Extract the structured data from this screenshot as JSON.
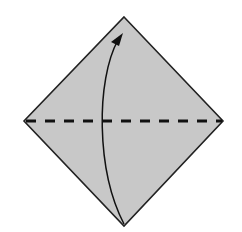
{
  "diagram": {
    "type": "origami-fold-step",
    "description": "Valley fold: fold bottom corner up to top corner along horizontal diagonal",
    "paper": {
      "shape": "diamond",
      "fill": "#c8c8c8",
      "stroke": "#222222",
      "vertices": {
        "top": [
          124,
          17
        ],
        "right": [
          223,
          121
        ],
        "bottom": [
          124,
          226
        ],
        "left": [
          24,
          121
        ]
      }
    },
    "fold_line": {
      "style": "dashed",
      "kind": "valley-fold",
      "from": [
        26,
        121
      ],
      "to": [
        222,
        121
      ],
      "color": "#111111",
      "dash": [
        10,
        9
      ]
    },
    "arrow": {
      "direction": "bottom-to-top",
      "path": "M124 224 C 96 170, 96 80, 120 38",
      "color": "#111111",
      "head_tip": [
        123,
        33
      ]
    }
  }
}
